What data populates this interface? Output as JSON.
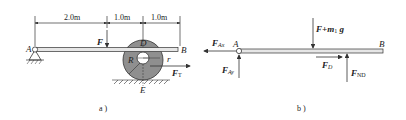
{
  "figure_a": {
    "caption": "a )",
    "dimensions": [
      "2.0m",
      "1.0m",
      "1.0m"
    ],
    "labels": {
      "A": "A",
      "B": "B",
      "D": "D",
      "E": "E",
      "R": "R",
      "r": "r",
      "F": "F",
      "FT_main": "F",
      "FT_sub": "T"
    }
  },
  "figure_b": {
    "caption": "b )",
    "labels": {
      "A": "A",
      "B": "B",
      "FAx_main": "F",
      "FAx_sub": "Ax",
      "FAy_main": "F",
      "FAy_sub": "Ay",
      "load_main": "F+m",
      "load_sub": "1",
      "load_g": " g",
      "FD_main": "F",
      "FD_sub": "D",
      "FND_main": "F",
      "FND_sub": "ND"
    }
  },
  "colors": {
    "line": "#222222",
    "beam_fill": "#e6e6e6",
    "disk_fill": "#8f8f8f"
  }
}
